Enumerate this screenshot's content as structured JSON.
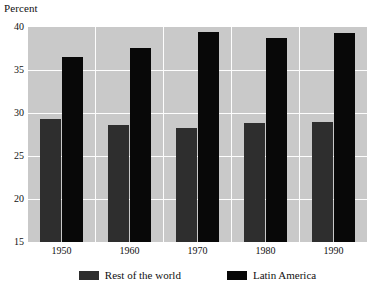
{
  "chart_data": {
    "type": "bar",
    "title": "",
    "ylabel": "Percent",
    "xlabel": "",
    "categories": [
      "1950",
      "1960",
      "1970",
      "1980",
      "1990"
    ],
    "series": [
      {
        "name": "Rest of the world",
        "color": "#2e2e2e",
        "values": [
          29.3,
          28.6,
          28.3,
          28.8,
          29.0
        ]
      },
      {
        "name": "Latin America",
        "color": "#080808",
        "values": [
          36.5,
          37.6,
          39.4,
          38.7,
          39.3
        ]
      }
    ],
    "ylim": [
      15,
      40
    ],
    "yticks": [
      40,
      35,
      30,
      25,
      20,
      15
    ],
    "ytick_labels": [
      "40",
      "35",
      "30",
      "25",
      "20",
      "15"
    ],
    "grid": true,
    "gridlines_y": [
      35,
      30,
      25,
      20
    ],
    "legend_position": "bottom",
    "plot_background": "#c9c9c9",
    "gridline_color": "#fdfdfd",
    "page_background": "#ffffff"
  },
  "axis": {
    "y_title": "Percent"
  }
}
